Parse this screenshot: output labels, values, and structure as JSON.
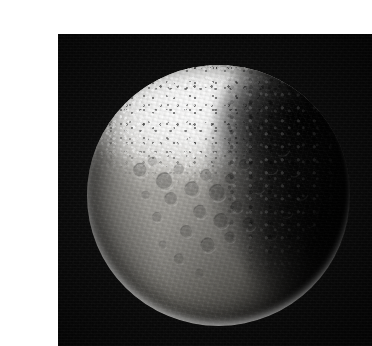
{
  "page": {
    "background_color": "#ffffff",
    "width": 349,
    "height": 346,
    "caption": ""
  },
  "photo": {
    "name": "Iapetus",
    "alt_text": "Saturn's moon Iapetus, showing the bright icy north polar terrain and the dark Cassini Regio material",
    "plate_background_color": "#0a0a0a",
    "left": 18,
    "top": 18,
    "width": 314,
    "height": 312
  },
  "moon": {
    "center_x": 178,
    "center_y": 180,
    "radius": 131,
    "base_color": "#8b8984",
    "bright_terrain_color": "#f6f6f4",
    "dark_terrain_color": "#0b0b0b",
    "limb_highlight_color": "#ffffff",
    "regions": [
      {
        "name": "bright-polar-terrain",
        "label": "Roncevaux Terra",
        "cx": 0.4,
        "cy": 0.15,
        "brightness": 0.95
      },
      {
        "name": "mid-gray-cratered-plains",
        "label": "Sunlit cratered plains",
        "cx": 0.38,
        "cy": 0.55,
        "brightness": 0.55
      },
      {
        "name": "dark-terrain",
        "label": "Cassini Regio",
        "cx": 0.88,
        "cy": 0.42,
        "brightness": 0.05
      },
      {
        "name": "limb-highlight",
        "label": "Bright limb",
        "cx": 0.45,
        "cy": 0.97,
        "brightness": 0.85
      }
    ],
    "craters": [
      {
        "cx": 0.205,
        "cy": 0.405,
        "r": 0.028,
        "depth": 0.55
      },
      {
        "cx": 0.252,
        "cy": 0.372,
        "r": 0.019,
        "depth": 0.45
      },
      {
        "cx": 0.298,
        "cy": 0.448,
        "r": 0.034,
        "depth": 0.6
      },
      {
        "cx": 0.352,
        "cy": 0.402,
        "r": 0.022,
        "depth": 0.5
      },
      {
        "cx": 0.322,
        "cy": 0.515,
        "r": 0.026,
        "depth": 0.48
      },
      {
        "cx": 0.402,
        "cy": 0.478,
        "r": 0.03,
        "depth": 0.52
      },
      {
        "cx": 0.455,
        "cy": 0.425,
        "r": 0.024,
        "depth": 0.46
      },
      {
        "cx": 0.498,
        "cy": 0.492,
        "r": 0.033,
        "depth": 0.58
      },
      {
        "cx": 0.548,
        "cy": 0.438,
        "r": 0.021,
        "depth": 0.44
      },
      {
        "cx": 0.432,
        "cy": 0.565,
        "r": 0.027,
        "depth": 0.5
      },
      {
        "cx": 0.512,
        "cy": 0.6,
        "r": 0.03,
        "depth": 0.54
      },
      {
        "cx": 0.572,
        "cy": 0.545,
        "r": 0.023,
        "depth": 0.47
      },
      {
        "cx": 0.38,
        "cy": 0.64,
        "r": 0.025,
        "depth": 0.46
      },
      {
        "cx": 0.462,
        "cy": 0.692,
        "r": 0.029,
        "depth": 0.5
      },
      {
        "cx": 0.545,
        "cy": 0.662,
        "r": 0.022,
        "depth": 0.43
      },
      {
        "cx": 0.618,
        "cy": 0.612,
        "r": 0.026,
        "depth": 0.48
      },
      {
        "cx": 0.268,
        "cy": 0.585,
        "r": 0.02,
        "depth": 0.4
      },
      {
        "cx": 0.225,
        "cy": 0.5,
        "r": 0.017,
        "depth": 0.38
      },
      {
        "cx": 0.6,
        "cy": 0.382,
        "r": 0.02,
        "depth": 0.42
      },
      {
        "cx": 0.652,
        "cy": 0.47,
        "r": 0.024,
        "depth": 0.45
      },
      {
        "cx": 0.7,
        "cy": 0.392,
        "r": 0.028,
        "depth": 0.4
      },
      {
        "cx": 0.742,
        "cy": 0.318,
        "r": 0.031,
        "depth": 0.38
      },
      {
        "cx": 0.788,
        "cy": 0.402,
        "r": 0.026,
        "depth": 0.35
      },
      {
        "cx": 0.812,
        "cy": 0.488,
        "r": 0.03,
        "depth": 0.33
      },
      {
        "cx": 0.758,
        "cy": 0.56,
        "r": 0.027,
        "depth": 0.32
      },
      {
        "cx": 0.7,
        "cy": 0.648,
        "r": 0.024,
        "depth": 0.3
      },
      {
        "cx": 0.846,
        "cy": 0.6,
        "r": 0.022,
        "depth": 0.28
      },
      {
        "cx": 0.352,
        "cy": 0.745,
        "r": 0.021,
        "depth": 0.36
      },
      {
        "cx": 0.43,
        "cy": 0.8,
        "r": 0.018,
        "depth": 0.3
      },
      {
        "cx": 0.29,
        "cy": 0.69,
        "r": 0.016,
        "depth": 0.32
      }
    ]
  }
}
